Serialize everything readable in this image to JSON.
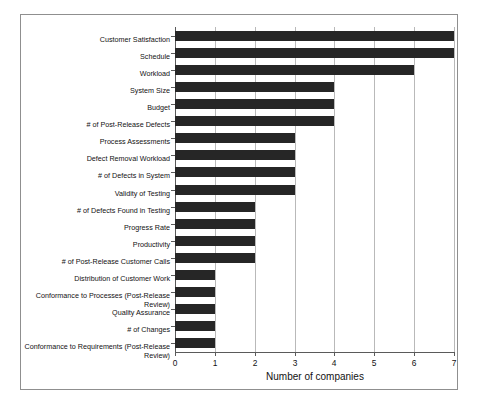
{
  "chart_data": {
    "type": "bar",
    "orientation": "horizontal",
    "title": "",
    "xlabel": "Number of companies",
    "ylabel": "",
    "xlim": [
      0,
      7
    ],
    "xticks": [
      "0",
      "1",
      "2",
      "3",
      "4",
      "5",
      "6",
      "7"
    ],
    "grid": true,
    "legend": null,
    "bar_color": "#262626",
    "gridline_color": "#b9b9b9",
    "axis_color": "#5a5a5a",
    "frame_color": "#8f8f8f",
    "categories": [
      "Customer Satisfaction",
      "Schedule",
      "Workload",
      "System Size",
      "Budget",
      "# of Post-Release Defects",
      "Process Assessments",
      "Defect Removal Workload",
      "# of Defects in System",
      "Validity of Testing",
      "# of Defects Found in Testing",
      "Progress Rate",
      "Productivity",
      "# of Post-Release Customer Calls",
      "Distribution of Customer Work",
      "Conformance to Processes (Post-Release Review)",
      "Quality Assurance",
      "# of Changes",
      "Conformance to Requirements (Post-Release Review)"
    ],
    "values": [
      7,
      7,
      6,
      4,
      4,
      4,
      3,
      3,
      3,
      3,
      2,
      2,
      2,
      2,
      1,
      1,
      1,
      1,
      1
    ]
  }
}
